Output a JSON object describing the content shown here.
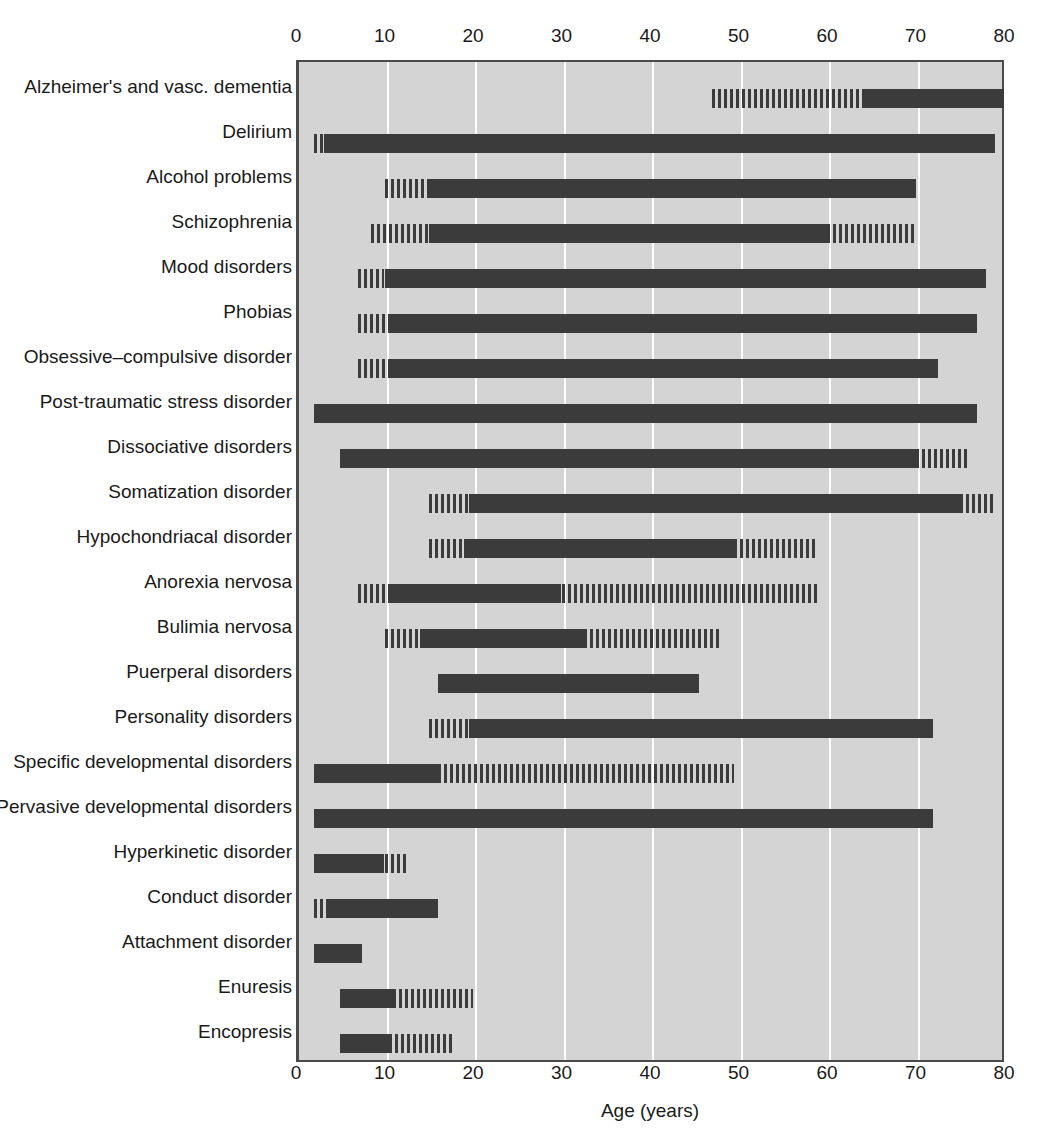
{
  "chart_data": {
    "type": "bar",
    "title": "",
    "subtitle": "",
    "xlabel": "Age (years)",
    "ylabel": "",
    "xlim": [
      0,
      80
    ],
    "xticks": [
      0,
      10,
      20,
      30,
      40,
      50,
      60,
      70,
      80
    ],
    "xtick_labels": [
      "0",
      "10",
      "20",
      "30",
      "40",
      "50",
      "60",
      "70",
      "80"
    ],
    "grid": true,
    "grid_axis": "x",
    "legend": [],
    "orientation": "horizontal",
    "colors": {
      "plot_background": "#d4d4d4",
      "bar_solid": "#3b3b3b",
      "bar_hatched": "#3b3b3b",
      "gridline": "#fdfdfd",
      "axis": "#4a4a4a",
      "text": "#1a1a1a",
      "page_background": "#ffffff"
    },
    "categories": [
      "Alzheimer's and vasc. dementia",
      "Delirium",
      "Alcohol problems",
      "Schizophrenia",
      "Mood disorders",
      "Phobias",
      "Obsessive–compulsive disorder",
      "Post-traumatic stress disorder",
      "Dissociative disorders",
      "Somatization disorder",
      "Hypochondriacal disorder",
      "Anorexia nervosa",
      "Bulimia nervosa",
      "Puerperal disorders",
      "Personality disorders",
      "Specific developmental disorders",
      "Pervasive developmental disorders",
      "Hyperkinetic disorder",
      "Conduct disorder",
      "Attachment disorder",
      "Enuresis",
      "Encopresis"
    ],
    "rows": [
      {
        "label": "Alzheimer's and vasc. dementia",
        "range": [
          47,
          80
        ],
        "segments": [
          {
            "start": 47,
            "end": 64,
            "style": "hatch"
          },
          {
            "start": 64,
            "end": 80,
            "style": "solid"
          }
        ]
      },
      {
        "label": "Delirium",
        "range": [
          2,
          79
        ],
        "segments": [
          {
            "start": 2,
            "end": 3.2,
            "style": "hatch"
          },
          {
            "start": 3.2,
            "end": 79,
            "style": "solid"
          }
        ]
      },
      {
        "label": "Alcohol problems",
        "range": [
          10,
          70
        ],
        "segments": [
          {
            "start": 10,
            "end": 15,
            "style": "hatch"
          },
          {
            "start": 15,
            "end": 70,
            "style": "solid"
          }
        ]
      },
      {
        "label": "Schizophrenia",
        "range": [
          8.5,
          70
        ],
        "segments": [
          {
            "start": 8.5,
            "end": 15,
            "style": "hatch"
          },
          {
            "start": 15,
            "end": 60,
            "style": "solid"
          },
          {
            "start": 60,
            "end": 70,
            "style": "hatch"
          }
        ]
      },
      {
        "label": "Mood disorders",
        "range": [
          7,
          78
        ],
        "segments": [
          {
            "start": 7,
            "end": 10,
            "style": "hatch"
          },
          {
            "start": 10,
            "end": 78,
            "style": "solid"
          }
        ]
      },
      {
        "label": "Phobias",
        "range": [
          7,
          77
        ],
        "segments": [
          {
            "start": 7,
            "end": 10.5,
            "style": "hatch"
          },
          {
            "start": 10.5,
            "end": 77,
            "style": "solid"
          }
        ]
      },
      {
        "label": "Obsessive–compulsive disorder",
        "range": [
          7,
          72.5
        ],
        "segments": [
          {
            "start": 7,
            "end": 10.5,
            "style": "hatch"
          },
          {
            "start": 10.5,
            "end": 72.5,
            "style": "solid"
          }
        ]
      },
      {
        "label": "Post-traumatic stress disorder",
        "range": [
          2,
          77
        ],
        "segments": [
          {
            "start": 2,
            "end": 77,
            "style": "solid"
          }
        ]
      },
      {
        "label": "Dissociative disorders",
        "range": [
          5,
          76
        ],
        "segments": [
          {
            "start": 5,
            "end": 70,
            "style": "solid"
          },
          {
            "start": 70,
            "end": 76,
            "style": "hatch"
          }
        ]
      },
      {
        "label": "Somatization disorder",
        "range": [
          15,
          79
        ],
        "segments": [
          {
            "start": 15,
            "end": 19.5,
            "style": "hatch"
          },
          {
            "start": 19.5,
            "end": 75,
            "style": "solid"
          },
          {
            "start": 75,
            "end": 79,
            "style": "hatch"
          }
        ]
      },
      {
        "label": "Hypochondriacal disorder",
        "range": [
          15,
          59
        ],
        "segments": [
          {
            "start": 15,
            "end": 19,
            "style": "hatch"
          },
          {
            "start": 19,
            "end": 49.5,
            "style": "solid"
          },
          {
            "start": 49.5,
            "end": 59,
            "style": "hatch"
          }
        ]
      },
      {
        "label": "Anorexia nervosa",
        "range": [
          7,
          59
        ],
        "segments": [
          {
            "start": 7,
            "end": 10.5,
            "style": "hatch"
          },
          {
            "start": 10.5,
            "end": 30,
            "style": "solid"
          },
          {
            "start": 30,
            "end": 59,
            "style": "hatch"
          }
        ]
      },
      {
        "label": "Bulimia nervosa",
        "range": [
          10,
          48
        ],
        "segments": [
          {
            "start": 10,
            "end": 14,
            "style": "hatch"
          },
          {
            "start": 14,
            "end": 32.5,
            "style": "solid"
          },
          {
            "start": 32.5,
            "end": 48,
            "style": "hatch"
          }
        ]
      },
      {
        "label": "Puerperal disorders",
        "range": [
          16,
          45.5
        ],
        "segments": [
          {
            "start": 16,
            "end": 45.5,
            "style": "solid"
          }
        ]
      },
      {
        "label": "Personality disorders",
        "range": [
          15,
          72
        ],
        "segments": [
          {
            "start": 15,
            "end": 19.5,
            "style": "hatch"
          },
          {
            "start": 19.5,
            "end": 72,
            "style": "solid"
          }
        ]
      },
      {
        "label": "Specific developmental disorders",
        "range": [
          2,
          49.5
        ],
        "segments": [
          {
            "start": 2,
            "end": 16,
            "style": "solid"
          },
          {
            "start": 16,
            "end": 49.5,
            "style": "hatch"
          }
        ]
      },
      {
        "label": "Pervasive developmental disorders",
        "range": [
          2,
          72
        ],
        "segments": [
          {
            "start": 2,
            "end": 72,
            "style": "solid"
          }
        ]
      },
      {
        "label": "Hyperkinetic disorder",
        "range": [
          2,
          12.5
        ],
        "segments": [
          {
            "start": 2,
            "end": 10,
            "style": "solid"
          },
          {
            "start": 10,
            "end": 12.5,
            "style": "hatch"
          }
        ]
      },
      {
        "label": "Conduct disorder",
        "range": [
          2,
          16
        ],
        "segments": [
          {
            "start": 2,
            "end": 3.5,
            "style": "hatch"
          },
          {
            "start": 3.5,
            "end": 16,
            "style": "solid"
          }
        ]
      },
      {
        "label": "Attachment disorder",
        "range": [
          2,
          7.5
        ],
        "segments": [
          {
            "start": 2,
            "end": 7.5,
            "style": "solid"
          }
        ]
      },
      {
        "label": "Enuresis",
        "range": [
          5,
          20
        ],
        "segments": [
          {
            "start": 5,
            "end": 11,
            "style": "solid"
          },
          {
            "start": 11,
            "end": 20,
            "style": "hatch"
          }
        ]
      },
      {
        "label": "Encopresis",
        "range": [
          5,
          18
        ],
        "segments": [
          {
            "start": 5,
            "end": 10.5,
            "style": "solid"
          },
          {
            "start": 10.5,
            "end": 18,
            "style": "hatch"
          }
        ]
      }
    ]
  }
}
